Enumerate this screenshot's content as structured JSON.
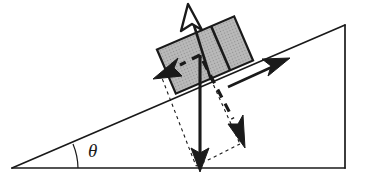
{
  "figure": {
    "kind": "physics-free-body-diagram",
    "background_color": "#ffffff",
    "stroke_color": "#1a1a1a"
  },
  "labels": {
    "incline_angle": "θ"
  },
  "incline": {
    "name": "inclined-plane",
    "apex_left": [
      12,
      168
    ],
    "apex_top_right": [
      345,
      25
    ],
    "corner_bottom_right": [
      345,
      168
    ],
    "baseline_color": "#1a1a1a",
    "angle_arc_color": "#1a1a1a"
  },
  "block": {
    "name": "block-on-incline",
    "fill_color": "#b3b3b3",
    "edge_color": "#1a1a1a",
    "divider": true,
    "tilt_degrees": 23
  },
  "vectors": [
    {
      "name": "normal-force-arrow",
      "style": "solid",
      "direction": "up-perpendicular-to-incline",
      "head": "outlined",
      "color": "#1a1a1a"
    },
    {
      "name": "up-slope-arrow",
      "style": "solid",
      "direction": "up-along-incline",
      "head": "filled",
      "color": "#1a1a1a"
    },
    {
      "name": "weight-arrow",
      "style": "solid",
      "direction": "straight-down",
      "head": "filled",
      "color": "#1a1a1a"
    },
    {
      "name": "weight-parallel-component-arrow",
      "style": "dashed",
      "direction": "down-slope-up-left",
      "head": "filled",
      "color": "#1a1a1a"
    },
    {
      "name": "weight-perpendicular-component-arrow",
      "style": "dashed",
      "direction": "into-incline-down-right",
      "head": "filled",
      "color": "#1a1a1a"
    }
  ],
  "construction_lines": {
    "name": "parallelogram-construction-lines",
    "style": "dotted",
    "color": "#1a1a1a"
  }
}
